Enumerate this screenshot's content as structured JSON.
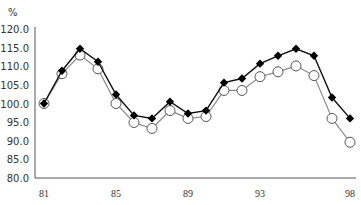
{
  "chart_data": {
    "type": "line",
    "title": "",
    "ylabel": "%",
    "xlabel": "",
    "ylim": [
      80.0,
      120.0
    ],
    "yticks": [
      "120.0",
      "115.0",
      "110.0",
      "105.0",
      "100.0",
      "95.0",
      "90.0",
      "85.0",
      "80.0"
    ],
    "xticks": [
      "81",
      "85",
      "89",
      "93",
      "98"
    ],
    "grid": false,
    "legend": null,
    "x": [
      81,
      82,
      83,
      84,
      85,
      86,
      87,
      88,
      89,
      90,
      91,
      92,
      93,
      94,
      95,
      96,
      97,
      98
    ],
    "series": [
      {
        "name": "series-filled-diamond",
        "marker": "filled-diamond",
        "color": "#000000",
        "values": [
          100.0,
          108.8,
          114.7,
          111.2,
          102.4,
          96.8,
          96.0,
          100.5,
          97.3,
          98.1,
          105.6,
          106.7,
          110.7,
          112.8,
          114.7,
          112.8,
          101.6,
          96.0
        ]
      },
      {
        "name": "series-hollow-circle",
        "marker": "hollow-circle",
        "color": "#888888",
        "values": [
          100.0,
          108.0,
          113.0,
          109.3,
          100.0,
          94.9,
          93.3,
          98.1,
          96.0,
          96.5,
          103.5,
          103.5,
          107.2,
          108.5,
          110.1,
          107.5,
          96.0,
          89.6
        ]
      }
    ]
  },
  "axis": {
    "unit_label": "%"
  }
}
